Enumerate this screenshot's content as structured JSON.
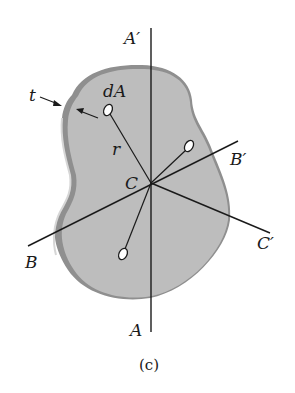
{
  "figure": {
    "caption": "(c)",
    "labels": {
      "thickness": "t",
      "area_element": "dA",
      "radius": "r",
      "centroid": "C",
      "axis_a_top": "A′",
      "axis_a_bottom": "A",
      "axis_b_left": "B",
      "axis_b_right": "B′",
      "axis_c_right": "C′"
    },
    "colors": {
      "plate_face": "#bdbdbd",
      "plate_edge": "#8f8f8f",
      "plate_edge_highlight": "#d6d6d6",
      "lines": "#1a1a1a",
      "background": "#ffffff"
    }
  }
}
